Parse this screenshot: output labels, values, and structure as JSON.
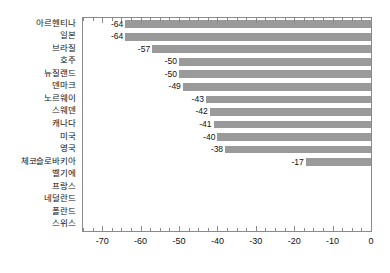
{
  "chart_data": {
    "type": "bar",
    "orientation": "horizontal",
    "title": "",
    "subtitle": "",
    "xlabel": "",
    "ylabel": "",
    "xlim": [
      -75,
      0
    ],
    "ylim": [
      0,
      16
    ],
    "grid": false,
    "legend": null,
    "legend_position": "none",
    "bar_color": "#9a9a9a",
    "axis_color": "#8a8a8a",
    "text_color": "#111111",
    "background_color": "#ffffff",
    "value_label_format": "integer",
    "categories": [
      "아르헨티나",
      "일본",
      "브라질",
      "호주",
      "뉴질랜드",
      "덴마크",
      "노르웨이",
      "스웨덴",
      "캐나다",
      "미국",
      "영국",
      "체코슬로바키아",
      "벨기에",
      "프랑스",
      "네덜란드",
      "폴란드",
      "스위스"
    ],
    "values": [
      -64,
      -64,
      -57,
      -50,
      -50,
      -49,
      -43,
      -42,
      -41,
      -40,
      -38,
      -17,
      0,
      0,
      0,
      0,
      0
    ],
    "value_labels": [
      "-64",
      "-64",
      "-57",
      "-50",
      "-50",
      "-49",
      "-43",
      "-42",
      "-41",
      "-40",
      "-38",
      "-17",
      "",
      "",
      "",
      "",
      ""
    ],
    "xticks": [
      -70,
      -60,
      -50,
      -40,
      -30,
      -20,
      -10,
      0
    ],
    "xtick_labels": [
      "-70",
      "-60",
      "-50",
      "-40",
      "-30",
      "-20",
      "-10",
      "0"
    ],
    "x_minor_tick_step": 2.5,
    "ticks_direction": "inward-outward"
  }
}
